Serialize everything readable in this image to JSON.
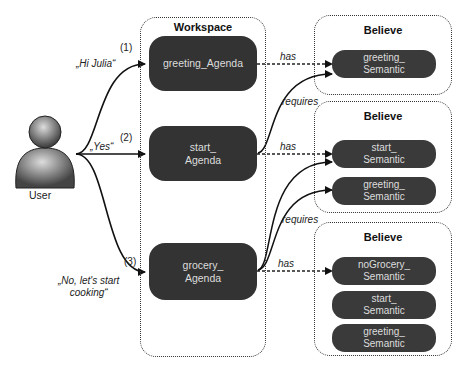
{
  "user": {
    "label": "User"
  },
  "utterances": [
    {
      "number": "(1)",
      "text": "„Hi Julia“"
    },
    {
      "number": "(2)",
      "text": "„Yes“"
    },
    {
      "number": "(3)",
      "text": "„No, let's start\ncooking“"
    }
  ],
  "workspace": {
    "title": "Workspace",
    "agendas": [
      {
        "label": "greeting_Agenda"
      },
      {
        "label": "start_\nAgenda"
      },
      {
        "label": "grocery_\nAgenda"
      }
    ]
  },
  "believes": [
    {
      "title": "Believe",
      "semantics": [
        "greeting_\nSemantic"
      ]
    },
    {
      "title": "Believe",
      "semantics": [
        "start_\nSemantic",
        "greeting_\nSemantic"
      ]
    },
    {
      "title": "Believe",
      "semantics": [
        "noGrocery_\nSemantic",
        "start_\nSemantic",
        "greeting_\nSemantic"
      ]
    }
  ],
  "edge_labels": {
    "has": "has",
    "requires": "requires"
  }
}
